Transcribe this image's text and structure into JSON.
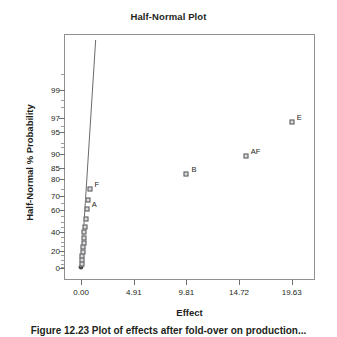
{
  "figure": {
    "caption": "Figure 12.23  Plot of effects after fold-over on production..."
  },
  "chart_data": {
    "type": "scatter",
    "title": "Half-Normal Plot",
    "xlabel": "Effect",
    "ylabel": "Half-Normal % Probability",
    "grid": false,
    "legend": "none",
    "xlim": [
      -1.6,
      21.8
    ],
    "ylim": [
      0,
      99.9
    ],
    "xticks": [
      "0.00",
      "4.91",
      "9.81",
      "14.72",
      "19.63"
    ],
    "xtick_values": [
      0.0,
      4.91,
      9.81,
      14.72,
      19.63
    ],
    "yticks": [
      "0",
      "20",
      "40",
      "60",
      "70",
      "80",
      "85",
      "90",
      "95",
      "97",
      "99"
    ],
    "ytick_values": [
      0,
      20,
      40,
      60,
      70,
      80,
      85,
      90,
      95,
      97,
      99
    ],
    "reference_line": {
      "label": "normal-reference-line",
      "x_start": 0.0,
      "y_start": 0.0,
      "x_end": 1.35,
      "y_end": 99.9
    },
    "points": [
      {
        "label": "",
        "x": 0.02,
        "y": 1.8
      },
      {
        "label": "",
        "x": 0.05,
        "y": 5.4
      },
      {
        "label": "",
        "x": 0.09,
        "y": 9.1
      },
      {
        "label": "",
        "x": 0.12,
        "y": 14.0
      },
      {
        "label": "",
        "x": 0.15,
        "y": 19.0
      },
      {
        "label": "",
        "x": 0.18,
        "y": 24.0
      },
      {
        "label": "",
        "x": 0.22,
        "y": 29.0
      },
      {
        "label": "",
        "x": 0.26,
        "y": 34.0
      },
      {
        "label": "",
        "x": 0.3,
        "y": 39.5
      },
      {
        "label": "",
        "x": 0.36,
        "y": 45.0
      },
      {
        "label": "",
        "x": 0.44,
        "y": 52.0
      },
      {
        "label": "A",
        "x": 0.52,
        "y": 60.5
      },
      {
        "label": "",
        "x": 0.62,
        "y": 67.5
      },
      {
        "label": "F",
        "x": 0.78,
        "y": 75.0
      },
      {
        "label": "B",
        "x": 9.81,
        "y": 82.5
      },
      {
        "label": "AF",
        "x": 15.35,
        "y": 89.5
      },
      {
        "label": "E",
        "x": 19.63,
        "y": 96.5
      }
    ]
  }
}
